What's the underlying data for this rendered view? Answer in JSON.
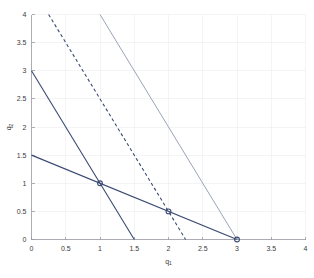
{
  "chart_data": {
    "type": "line",
    "title": "",
    "subtitle": "",
    "xlabel": "q1",
    "xlabel_base": "q",
    "xlabel_sub": "1",
    "ylabel": "q2",
    "ylabel_base": "q",
    "ylabel_sub": "2",
    "xlim": [
      0,
      4
    ],
    "ylim": [
      0,
      4
    ],
    "xticks": [
      0,
      0.5,
      1,
      1.5,
      2,
      2.5,
      3,
      3.5,
      4
    ],
    "xticklabels": [
      "0",
      "0.5",
      "1",
      "1.5",
      "2",
      "2.5",
      "3",
      "3.5",
      "4"
    ],
    "yticks": [
      0,
      0.5,
      1,
      1.5,
      2,
      2.5,
      3,
      3.5,
      4
    ],
    "yticklabels": [
      "0",
      "0.5",
      "1",
      "1.5",
      "2",
      "2.5",
      "3",
      "3.5",
      "4"
    ],
    "grid": true,
    "legend": "none",
    "background_color": "#ffffff",
    "grid_color": "#ececf2",
    "axis_color": "#9a9aa2",
    "series": [
      {
        "name": "steep-solid-navy",
        "style": "solid",
        "color": "#3a4a72",
        "width": 1.1,
        "points": [
          [
            0,
            3
          ],
          [
            1.5,
            0
          ]
        ],
        "slope": -2,
        "intercept": 3
      },
      {
        "name": "shallow-solid-navy",
        "style": "solid",
        "color": "#3a4a72",
        "width": 1.1,
        "points": [
          [
            0,
            1.5
          ],
          [
            3,
            0
          ]
        ],
        "slope": -0.5,
        "intercept": 1.5
      },
      {
        "name": "dashed-navy",
        "style": "dashed",
        "color": "#3a4a72",
        "width": 1.1,
        "points": [
          [
            0.25,
            4
          ],
          [
            2.25,
            0
          ]
        ],
        "slope": -2,
        "intercept": 4.5
      },
      {
        "name": "light-gray-solid",
        "style": "solid",
        "color": "#9aa3b8",
        "width": 1.0,
        "points": [
          [
            1,
            4
          ],
          [
            3,
            0
          ]
        ],
        "slope": -2,
        "intercept": 6
      }
    ],
    "markers": [
      {
        "name": "marker-1-1",
        "x": 1,
        "y": 1,
        "shape": "circle-open",
        "color": "#3a4a72",
        "radius": 2.4
      },
      {
        "name": "marker-2-0.5",
        "x": 2,
        "y": 0.5,
        "shape": "circle-open",
        "color": "#3a4a72",
        "radius": 2.4
      },
      {
        "name": "marker-3-0",
        "x": 3,
        "y": 0,
        "shape": "circle-open",
        "color": "#3a4a72",
        "radius": 2.4
      }
    ]
  }
}
